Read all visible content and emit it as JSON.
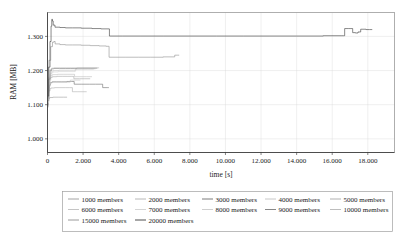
{
  "chart_data": {
    "type": "line",
    "title": "",
    "xlabel": "time [s]",
    "ylabel": "RAM [MB]",
    "xlim": [
      0,
      19500
    ],
    "ylim": [
      960,
      1370
    ],
    "grid": true,
    "legend_position": "bottom",
    "xticks": [
      {
        "value": 0,
        "label": "0"
      },
      {
        "value": 2000,
        "label": "2.000"
      },
      {
        "value": 4000,
        "label": "4.000"
      },
      {
        "value": 6000,
        "label": "6.000"
      },
      {
        "value": 8000,
        "label": "8.000"
      },
      {
        "value": 10000,
        "label": "10.000"
      },
      {
        "value": 12000,
        "label": "12.000"
      },
      {
        "value": 14000,
        "label": "14.000"
      },
      {
        "value": 16000,
        "label": "16.000"
      },
      {
        "value": 18000,
        "label": "18.000"
      }
    ],
    "yticks": [
      {
        "value": 1000,
        "label": "1.000"
      },
      {
        "value": 1100,
        "label": "1.100"
      },
      {
        "value": 1200,
        "label": "1.200"
      },
      {
        "value": 1300,
        "label": "1.300"
      }
    ],
    "series": [
      {
        "name": "1000 members",
        "color": "#9a9a9a",
        "points": [
          [
            0,
            1092
          ],
          [
            30,
            1110
          ],
          [
            70,
            1118
          ],
          [
            110,
            1120
          ],
          [
            150,
            1121
          ],
          [
            300,
            1122
          ],
          [
            600,
            1122
          ],
          [
            900,
            1122
          ],
          [
            1100,
            1122
          ]
        ]
      },
      {
        "name": "2000 members",
        "color": "#b0b0b0",
        "points": [
          [
            0,
            1095
          ],
          [
            40,
            1125
          ],
          [
            90,
            1140
          ],
          [
            140,
            1147
          ],
          [
            200,
            1149
          ],
          [
            400,
            1150
          ],
          [
            700,
            1150
          ],
          [
            1000,
            1150
          ],
          [
            1250,
            1150
          ],
          [
            1400,
            1138
          ],
          [
            1700,
            1138
          ],
          [
            2050,
            1138
          ],
          [
            2200,
            1138
          ]
        ]
      },
      {
        "name": "3000 members",
        "color": "#6e6e6e",
        "points": [
          [
            0,
            1100
          ],
          [
            50,
            1140
          ],
          [
            110,
            1158
          ],
          [
            170,
            1165
          ],
          [
            260,
            1167
          ],
          [
            500,
            1167
          ],
          [
            800,
            1167
          ],
          [
            1100,
            1168
          ],
          [
            1350,
            1168
          ],
          [
            1500,
            1160
          ],
          [
            1900,
            1160
          ],
          [
            2350,
            1160
          ],
          [
            2700,
            1160
          ],
          [
            3000,
            1160
          ],
          [
            3100,
            1150
          ],
          [
            3350,
            1150
          ],
          [
            3450,
            1150
          ]
        ]
      },
      {
        "name": "4000 members",
        "color": "#c2c2c2",
        "points": [
          [
            0,
            1098
          ],
          [
            45,
            1135
          ],
          [
            100,
            1155
          ],
          [
            160,
            1163
          ],
          [
            240,
            1166
          ],
          [
            450,
            1166
          ],
          [
            700,
            1166
          ],
          [
            950,
            1166
          ],
          [
            1150,
            1166
          ],
          [
            1280,
            1172
          ],
          [
            1600,
            1172
          ],
          [
            1850,
            1172
          ]
        ]
      },
      {
        "name": "5000 members",
        "color": "#a8a8a8",
        "points": [
          [
            0,
            1102
          ],
          [
            55,
            1150
          ],
          [
            120,
            1172
          ],
          [
            180,
            1180
          ],
          [
            270,
            1182
          ],
          [
            520,
            1183
          ],
          [
            830,
            1183
          ],
          [
            1100,
            1183
          ],
          [
            1330,
            1183
          ],
          [
            1480,
            1176
          ],
          [
            1800,
            1176
          ],
          [
            2100,
            1176
          ],
          [
            2400,
            1176
          ]
        ]
      },
      {
        "name": "6000 members",
        "color": "#bdbdbd",
        "points": [
          [
            0,
            1104
          ],
          [
            55,
            1155
          ],
          [
            125,
            1178
          ],
          [
            190,
            1186
          ],
          [
            280,
            1188
          ],
          [
            560,
            1189
          ],
          [
            880,
            1189
          ],
          [
            1150,
            1189
          ],
          [
            1380,
            1189
          ],
          [
            1520,
            1182
          ],
          [
            1830,
            1182
          ],
          [
            2180,
            1182
          ],
          [
            2500,
            1182
          ]
        ]
      },
      {
        "name": "7000 members",
        "color": "#d0d0d0",
        "points": [
          [
            0,
            1106
          ],
          [
            60,
            1160
          ],
          [
            130,
            1185
          ],
          [
            200,
            1193
          ],
          [
            300,
            1196
          ],
          [
            600,
            1197
          ],
          [
            930,
            1197
          ],
          [
            1200,
            1197
          ],
          [
            1430,
            1197
          ],
          [
            1560,
            1204
          ],
          [
            1900,
            1204
          ],
          [
            2250,
            1204
          ],
          [
            2600,
            1204
          ]
        ]
      },
      {
        "name": "8000 members",
        "color": "#cacaca",
        "points": [
          [
            0,
            1108
          ],
          [
            60,
            1165
          ],
          [
            135,
            1190
          ],
          [
            210,
            1198
          ],
          [
            320,
            1200
          ],
          [
            640,
            1201
          ],
          [
            970,
            1201
          ],
          [
            1240,
            1201
          ],
          [
            1460,
            1201
          ],
          [
            1600,
            1205
          ],
          [
            1960,
            1205
          ],
          [
            2320,
            1205
          ],
          [
            2700,
            1205
          ]
        ]
      },
      {
        "name": "9000 members",
        "color": "#7a7a7a",
        "points": [
          [
            0,
            1112
          ],
          [
            65,
            1175
          ],
          [
            145,
            1200
          ],
          [
            225,
            1205
          ],
          [
            350,
            1206
          ],
          [
            680,
            1206
          ],
          [
            1010,
            1206
          ],
          [
            1280,
            1206
          ],
          [
            1500,
            1206
          ],
          [
            1640,
            1207
          ],
          [
            2000,
            1207
          ],
          [
            2400,
            1207
          ],
          [
            2800,
            1207
          ]
        ]
      },
      {
        "name": "10000 members",
        "color": "#b6b6b6",
        "points": [
          [
            0,
            1114
          ],
          [
            70,
            1180
          ],
          [
            150,
            1203
          ],
          [
            240,
            1207
          ],
          [
            380,
            1208
          ],
          [
            720,
            1208
          ],
          [
            1060,
            1208
          ],
          [
            1340,
            1208
          ],
          [
            1550,
            1208
          ],
          [
            1690,
            1208
          ],
          [
            2050,
            1208
          ],
          [
            2450,
            1208
          ],
          [
            2900,
            1208
          ]
        ]
      },
      {
        "name": "15000 members",
        "color": "#8f8f8f",
        "points": [
          [
            0,
            1120
          ],
          [
            80,
            1230
          ],
          [
            180,
            1270
          ],
          [
            280,
            1283
          ],
          [
            360,
            1285
          ],
          [
            430,
            1278
          ],
          [
            700,
            1276
          ],
          [
            1000,
            1275
          ],
          [
            1400,
            1275
          ],
          [
            1900,
            1274
          ],
          [
            2400,
            1273
          ],
          [
            2900,
            1272
          ],
          [
            3300,
            1271
          ],
          [
            3440,
            1271
          ],
          [
            3460,
            1239
          ],
          [
            3800,
            1239
          ],
          [
            4400,
            1239
          ],
          [
            5100,
            1239
          ],
          [
            5800,
            1239
          ],
          [
            6500,
            1240
          ],
          [
            7000,
            1240
          ],
          [
            7150,
            1245
          ],
          [
            7300,
            1245
          ],
          [
            7400,
            1245
          ]
        ]
      },
      {
        "name": "20000 members",
        "color": "#3b3b3b",
        "points": [
          [
            0,
            1125
          ],
          [
            60,
            1210
          ],
          [
            140,
            1285
          ],
          [
            200,
            1330
          ],
          [
            240,
            1350
          ],
          [
            280,
            1345
          ],
          [
            320,
            1333
          ],
          [
            420,
            1327
          ],
          [
            700,
            1326
          ],
          [
            1000,
            1325
          ],
          [
            1400,
            1325
          ],
          [
            1900,
            1324
          ],
          [
            2500,
            1323
          ],
          [
            3000,
            1322
          ],
          [
            3400,
            1322
          ],
          [
            3480,
            1301
          ],
          [
            4200,
            1301
          ],
          [
            5200,
            1301
          ],
          [
            6500,
            1301
          ],
          [
            8000,
            1301
          ],
          [
            9500,
            1301
          ],
          [
            11000,
            1301
          ],
          [
            12500,
            1301
          ],
          [
            14000,
            1301
          ],
          [
            15500,
            1302
          ],
          [
            16500,
            1302
          ],
          [
            16650,
            1302
          ],
          [
            16700,
            1323
          ],
          [
            16900,
            1323
          ],
          [
            17050,
            1323
          ],
          [
            17150,
            1311
          ],
          [
            17300,
            1310
          ],
          [
            17450,
            1313
          ],
          [
            17600,
            1321
          ],
          [
            17900,
            1320
          ],
          [
            18100,
            1320
          ],
          [
            18250,
            1320
          ]
        ]
      }
    ],
    "legend_rows": [
      [
        "1000 members",
        "2000 members",
        "3000 members",
        "4000 members",
        "5000 members"
      ],
      [
        "6000 members",
        "7000 members",
        "8000 members",
        "9000 members",
        "10000 members"
      ],
      [
        "15000 members",
        "20000 members"
      ]
    ]
  }
}
